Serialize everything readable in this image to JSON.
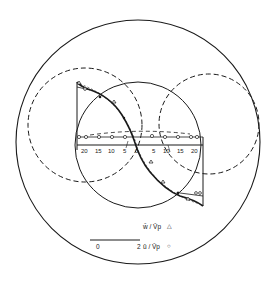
{
  "diagram": {
    "colors": {
      "ink": "#1a1a1a",
      "background": "#ffffff"
    },
    "axis": {
      "tick_labels": [
        "20",
        "15",
        "10",
        "5",
        "0",
        "5",
        "10",
        "15",
        "20"
      ]
    },
    "legend": {
      "entries": [
        {
          "label": "w̄ / V̄p",
          "marker": "triangle"
        },
        {
          "label": "ū / V̄p",
          "marker": "circle"
        }
      ],
      "scale_bar": {
        "start": "0",
        "end": "2"
      }
    }
  }
}
